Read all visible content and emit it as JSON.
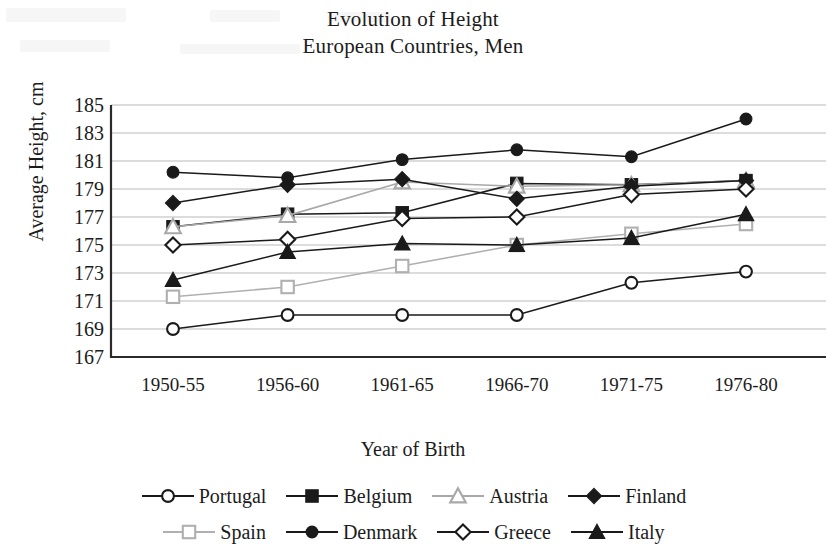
{
  "chart_data": {
    "type": "line",
    "title": "Evolution of Height",
    "subtitle": "European Countries, Men",
    "title_lines": [
      "Evolution of Height",
      "European Countries, Men"
    ],
    "xlabel": "Year of Birth",
    "ylabel": "Average Height, cm",
    "categories": [
      "1950-55",
      "1956-60",
      "1961-65",
      "1966-70",
      "1971-75",
      "1976-80"
    ],
    "ylim": [
      167,
      185
    ],
    "ytick_step": 2,
    "yticks": [
      185,
      183,
      181,
      179,
      177,
      175,
      173,
      171,
      169,
      167
    ],
    "grid": true,
    "legend_position": "bottom",
    "legend_columns": 4,
    "series": [
      {
        "name": "Portugal",
        "marker": "open-circle",
        "color": "#1a1a1a",
        "values": [
          169.0,
          170.0,
          170.0,
          170.0,
          172.3,
          173.1
        ]
      },
      {
        "name": "Belgium",
        "marker": "filled-square",
        "color": "#1a1a1a",
        "values": [
          176.3,
          177.2,
          177.3,
          179.4,
          179.3,
          179.6
        ]
      },
      {
        "name": "Austria",
        "marker": "open-triangle",
        "color": "#a8a8a8",
        "values": [
          176.3,
          177.1,
          179.5,
          179.2,
          179.3,
          179.6
        ]
      },
      {
        "name": "Finland",
        "marker": "filled-diamond",
        "color": "#1a1a1a",
        "values": [
          178.0,
          179.3,
          179.7,
          178.3,
          179.2,
          179.6
        ]
      },
      {
        "name": "Spain",
        "marker": "open-square",
        "color": "#b0b0b0",
        "values": [
          171.3,
          172.0,
          173.5,
          175.0,
          175.8,
          176.5
        ]
      },
      {
        "name": "Denmark",
        "marker": "filled-circle",
        "color": "#1a1a1a",
        "values": [
          180.2,
          179.8,
          181.1,
          181.8,
          181.3,
          184.0
        ]
      },
      {
        "name": "Greece",
        "marker": "open-diamond",
        "color": "#1a1a1a",
        "values": [
          175.0,
          175.4,
          176.9,
          177.0,
          178.6,
          179.0
        ]
      },
      {
        "name": "Italy",
        "marker": "filled-triangle",
        "color": "#1a1a1a",
        "values": [
          172.5,
          174.5,
          175.1,
          175.0,
          175.5,
          177.2
        ]
      }
    ]
  }
}
